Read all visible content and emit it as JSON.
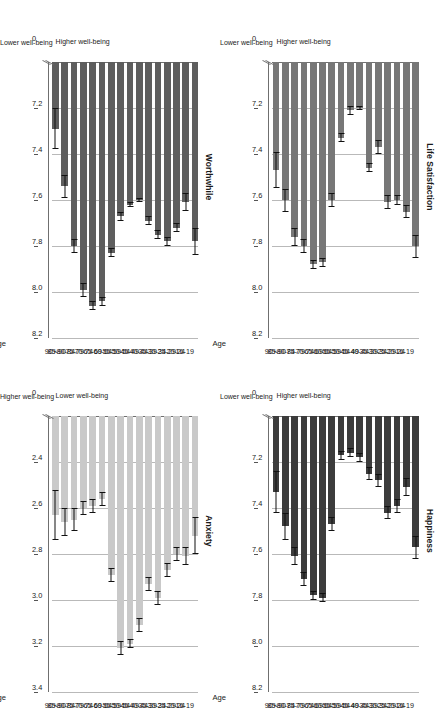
{
  "figure": {
    "categories": [
      "16-19",
      "20-24",
      "25-29",
      "30-34",
      "35-39",
      "40-44",
      "45-49",
      "50-54",
      "55-59",
      "60-64",
      "65-69",
      "70-74",
      "75-79",
      "80-84",
      "85-90",
      "90+"
    ],
    "age_axis_title": "Age",
    "note_lower": "Lower\nwell-being",
    "note_higher": "Higher\nwell-being",
    "note_lower_line1": "Lower",
    "note_lower_line2": "well-being",
    "note_higher_line1": "Higher",
    "note_higher_line2": "well-being",
    "colors": {
      "worthwhile_bar": "#5e5e5e",
      "life_satisfaction_bar": "#777777",
      "anxiety_bar": "#c9c9c9",
      "happiness_bar": "#3c3c3c",
      "gridline": "#b9b9b9",
      "axis": "#6f6f6f",
      "error_bar": "#111111"
    }
  },
  "chart_data": [
    {
      "id": "worthwhile",
      "type": "bar",
      "title": "Worthwhile",
      "orientation": "horizontal",
      "xlabel": "Age",
      "ylabel": "",
      "grid": true,
      "axis_low_label": "Lower well-being",
      "axis_high_label": "Higher well-being",
      "bar_color": "#5e5e5e",
      "xlim": [
        7.0,
        8.2
      ],
      "ticks": [
        0,
        7.2,
        7.4,
        7.6,
        7.8,
        8.0,
        8.2
      ],
      "tick_labels": [
        "0",
        "7.2",
        "7.4",
        "7.6",
        "7.8",
        "8.0",
        "8.2"
      ],
      "categories": [
        "16-19",
        "20-24",
        "25-29",
        "30-34",
        "35-39",
        "40-44",
        "45-49",
        "50-54",
        "55-59",
        "60-64",
        "65-69",
        "70-74",
        "75-79",
        "80-84",
        "85-90",
        "90+"
      ],
      "values": [
        7.78,
        7.61,
        7.72,
        7.78,
        7.75,
        7.69,
        7.6,
        7.62,
        7.67,
        7.83,
        8.04,
        8.06,
        7.99,
        7.8,
        7.54,
        7.29
      ],
      "err_low": [
        7.72,
        7.57,
        7.7,
        7.76,
        7.73,
        7.67,
        7.59,
        7.61,
        7.65,
        7.81,
        8.02,
        8.04,
        7.96,
        7.77,
        7.49,
        7.2
      ],
      "err_high": [
        7.84,
        7.65,
        7.74,
        7.8,
        7.77,
        7.71,
        7.61,
        7.63,
        7.69,
        7.85,
        8.06,
        8.08,
        8.02,
        7.83,
        7.59,
        7.38
      ]
    },
    {
      "id": "anxiety",
      "type": "bar",
      "title": "Anxiety",
      "orientation": "horizontal",
      "xlabel": "Age",
      "ylabel": "",
      "grid": true,
      "axis_low_label": "Higher well-being",
      "axis_high_label": "Lower well-being",
      "bar_color": "#c9c9c9",
      "xlim": [
        2.2,
        3.4
      ],
      "ticks": [
        0,
        2.4,
        2.6,
        2.8,
        3.0,
        3.2,
        3.4
      ],
      "tick_labels": [
        "0",
        "2.4",
        "2.6",
        "2.8",
        "3.0",
        "3.2",
        "3.4"
      ],
      "categories": [
        "16-19",
        "20-24",
        "25-29",
        "30-34",
        "35-39",
        "40-44",
        "45-49",
        "50-54",
        "55-59",
        "60-64",
        "65-69",
        "70-74",
        "75-79",
        "80-84",
        "85-90",
        "90+"
      ],
      "values": [
        2.72,
        2.81,
        2.8,
        2.87,
        2.99,
        2.93,
        3.11,
        3.19,
        3.21,
        2.89,
        2.56,
        2.59,
        2.6,
        2.65,
        2.66,
        2.63
      ],
      "err_low": [
        2.64,
        2.77,
        2.77,
        2.84,
        2.96,
        2.9,
        3.08,
        3.17,
        3.18,
        2.86,
        2.53,
        2.56,
        2.57,
        2.6,
        2.6,
        2.52
      ],
      "err_high": [
        2.8,
        2.85,
        2.83,
        2.9,
        3.02,
        2.96,
        3.14,
        3.21,
        3.24,
        2.92,
        2.59,
        2.62,
        2.63,
        2.7,
        2.72,
        2.74
      ]
    },
    {
      "id": "life_satisfaction",
      "type": "bar",
      "title": "Life Satisfaction",
      "orientation": "horizontal",
      "xlabel": "Age",
      "ylabel": "",
      "grid": true,
      "axis_low_label": "Lower well-being",
      "axis_high_label": "Higher well-being",
      "bar_color": "#777777",
      "xlim": [
        7.0,
        8.2
      ],
      "ticks": [
        0,
        7.2,
        7.4,
        7.6,
        7.8,
        8.0,
        8.2
      ],
      "tick_labels": [
        "0",
        "7.2",
        "7.4",
        "7.6",
        "7.8",
        "8.0",
        "8.2"
      ],
      "categories": [
        "16-19",
        "20-24",
        "25-29",
        "30-34",
        "35-39",
        "40-44",
        "45-49",
        "50-54",
        "55-59",
        "60-64",
        "65-69",
        "70-74",
        "75-79",
        "80-84",
        "85-90",
        "90+"
      ],
      "values": [
        7.8,
        7.65,
        7.6,
        7.61,
        7.37,
        7.46,
        7.2,
        7.21,
        7.33,
        7.6,
        7.87,
        7.88,
        7.8,
        7.76,
        7.6,
        7.47
      ],
      "err_low": [
        7.75,
        7.62,
        7.58,
        7.58,
        7.34,
        7.44,
        7.19,
        7.19,
        7.31,
        7.57,
        7.85,
        7.86,
        7.77,
        7.72,
        7.55,
        7.39
      ],
      "err_high": [
        7.85,
        7.68,
        7.62,
        7.64,
        7.4,
        7.48,
        7.21,
        7.23,
        7.35,
        7.63,
        7.89,
        7.9,
        7.83,
        7.8,
        7.65,
        7.55
      ]
    },
    {
      "id": "happiness",
      "type": "bar",
      "title": "Happiness",
      "orientation": "horizontal",
      "xlabel": "Age",
      "ylabel": "",
      "grid": true,
      "axis_low_label": "Lower well-being",
      "axis_high_label": "Higher well-being",
      "bar_color": "#3c3c3c",
      "xlim": [
        7.0,
        8.2
      ],
      "ticks": [
        0,
        7.2,
        7.4,
        7.6,
        7.8,
        8.0,
        8.2
      ],
      "tick_labels": [
        "0",
        "7.2",
        "7.4",
        "7.6",
        "7.8",
        "8.0",
        "8.2"
      ],
      "categories": [
        "16-19",
        "20-24",
        "25-29",
        "30-34",
        "35-39",
        "40-44",
        "45-49",
        "50-54",
        "55-59",
        "60-64",
        "65-69",
        "70-74",
        "75-79",
        "80-84",
        "85-90",
        "90+"
      ],
      "values": [
        7.57,
        7.31,
        7.39,
        7.42,
        7.28,
        7.25,
        7.18,
        7.16,
        7.17,
        7.47,
        7.79,
        7.78,
        7.71,
        7.61,
        7.48,
        7.33
      ],
      "err_low": [
        7.52,
        7.27,
        7.36,
        7.39,
        7.25,
        7.22,
        7.16,
        7.14,
        7.15,
        7.44,
        7.77,
        7.76,
        7.68,
        7.57,
        7.42,
        7.24
      ],
      "err_high": [
        7.62,
        7.35,
        7.42,
        7.45,
        7.31,
        7.28,
        7.2,
        7.18,
        7.19,
        7.5,
        7.81,
        7.8,
        7.74,
        7.65,
        7.54,
        7.42
      ]
    }
  ]
}
